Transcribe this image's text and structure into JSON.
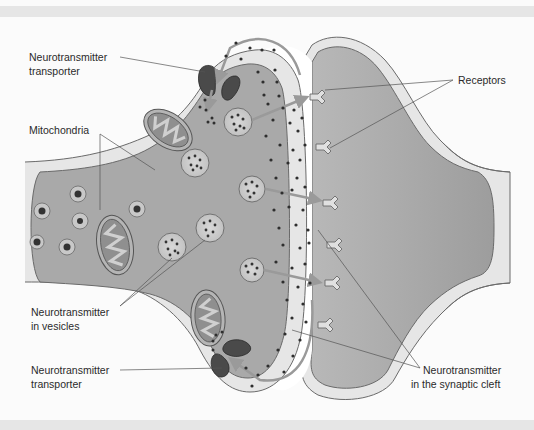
{
  "diagram": {
    "type": "chemical-synapse",
    "colors": {
      "cell_fill": "#a9a9a9",
      "membrane_fill": "#e6e6e6",
      "outline": "#6a6a6a",
      "cleft_fill": "#ffffff",
      "transporter": "#4a4a4a",
      "arrow": "#9a9a9a",
      "dot": "#2e2e2e",
      "background": "#fbfbfb",
      "band": "#e6e6e6"
    },
    "labels": {
      "transporter_top": {
        "line1": "Neurotransmitter",
        "line2": "transporter"
      },
      "mitochondria": {
        "line1": "Mitochondria"
      },
      "vesicles": {
        "line1": "Neurotransmitter",
        "line2": "in vesicles"
      },
      "transporter_bottom": {
        "line1": "Neurotransmitter",
        "line2": "transporter"
      },
      "receptors": {
        "line1": "Receptors"
      },
      "cleft": {
        "line1": "Neurotransmitter",
        "line2": "in the synaptic cleft"
      }
    }
  }
}
